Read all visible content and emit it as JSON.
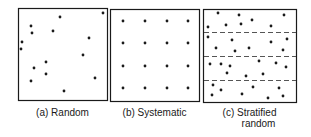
{
  "figure": {
    "ink_color": "#1a1a1a",
    "background": "#ffffff",
    "panels": [
      {
        "id": "random",
        "caption": "(a) Random",
        "box": {
          "x": 18,
          "y": 8,
          "w": 89,
          "h": 92
        },
        "strata_lines": [],
        "dots": [
          [
            103,
            13
          ],
          [
            60,
            17
          ],
          [
            31,
            26
          ],
          [
            32,
            33
          ],
          [
            53,
            31
          ],
          [
            22,
            42
          ],
          [
            21,
            49
          ],
          [
            89,
            38
          ],
          [
            83,
            55
          ],
          [
            46,
            62
          ],
          [
            34,
            68
          ],
          [
            46,
            74
          ],
          [
            31,
            81
          ],
          [
            95,
            78
          ],
          [
            64,
            91
          ]
        ]
      },
      {
        "id": "systematic",
        "caption": "(b) Systematic",
        "box": {
          "x": 110,
          "y": 9,
          "w": 89,
          "h": 92
        },
        "strata_lines": [],
        "dots": [
          [
            123,
            21
          ],
          [
            145,
            21
          ],
          [
            167,
            21
          ],
          [
            188,
            21
          ],
          [
            123,
            43
          ],
          [
            145,
            43
          ],
          [
            167,
            43
          ],
          [
            188,
            43
          ],
          [
            123,
            66
          ],
          [
            145,
            66
          ],
          [
            167,
            66
          ],
          [
            188,
            66
          ],
          [
            123,
            88
          ],
          [
            145,
            88
          ],
          [
            167,
            88
          ],
          [
            188,
            88
          ]
        ]
      },
      {
        "id": "stratified",
        "caption_line1": "(c) Stratified",
        "caption_line2": "random",
        "box": {
          "x": 203,
          "y": 9,
          "w": 93,
          "h": 93
        },
        "strata_lines": [
          32,
          56,
          80
        ],
        "dots": [
          [
            218,
            13
          ],
          [
            239,
            15
          ],
          [
            284,
            15
          ],
          [
            252,
            20
          ],
          [
            226,
            25
          ],
          [
            241,
            24
          ],
          [
            271,
            26
          ],
          [
            208,
            27
          ],
          [
            208,
            37
          ],
          [
            232,
            40
          ],
          [
            271,
            42
          ],
          [
            287,
            39
          ],
          [
            216,
            48
          ],
          [
            249,
            48
          ],
          [
            235,
            51
          ],
          [
            283,
            50
          ],
          [
            210,
            64
          ],
          [
            221,
            64
          ],
          [
            230,
            66
          ],
          [
            259,
            61
          ],
          [
            276,
            63
          ],
          [
            286,
            67
          ],
          [
            227,
            73
          ],
          [
            263,
            74
          ],
          [
            246,
            76
          ],
          [
            213,
            85
          ],
          [
            253,
            87
          ],
          [
            221,
            90
          ],
          [
            279,
            88
          ],
          [
            212,
            95
          ],
          [
            242,
            94
          ],
          [
            283,
            96
          ],
          [
            268,
            98
          ]
        ]
      }
    ]
  },
  "captions": {
    "a": "(a) Random",
    "b": "(b) Systematic",
    "c_line1": "(c) Stratified",
    "c_line2": "random"
  }
}
